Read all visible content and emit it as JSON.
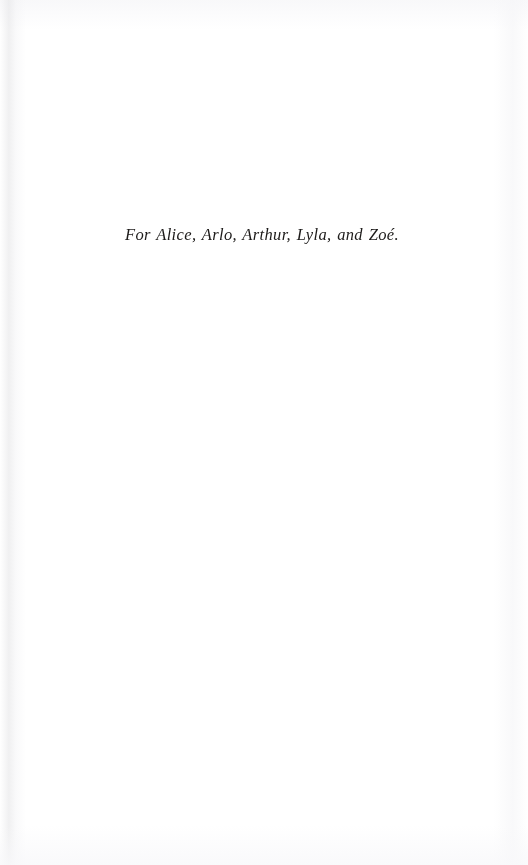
{
  "page": {
    "kind": "book-dedication-page",
    "background_color": "#ffffff",
    "ink_color": "#1d1b1a",
    "width_px": 528,
    "height_px": 865
  },
  "dedication": {
    "text": "For Alice, Arlo, Arthur, Lyla, and Zoé.",
    "names": [
      "Alice",
      "Arlo",
      "Arthur",
      "Lyla",
      "Zoé"
    ],
    "style": "italic",
    "alignment": "center"
  }
}
